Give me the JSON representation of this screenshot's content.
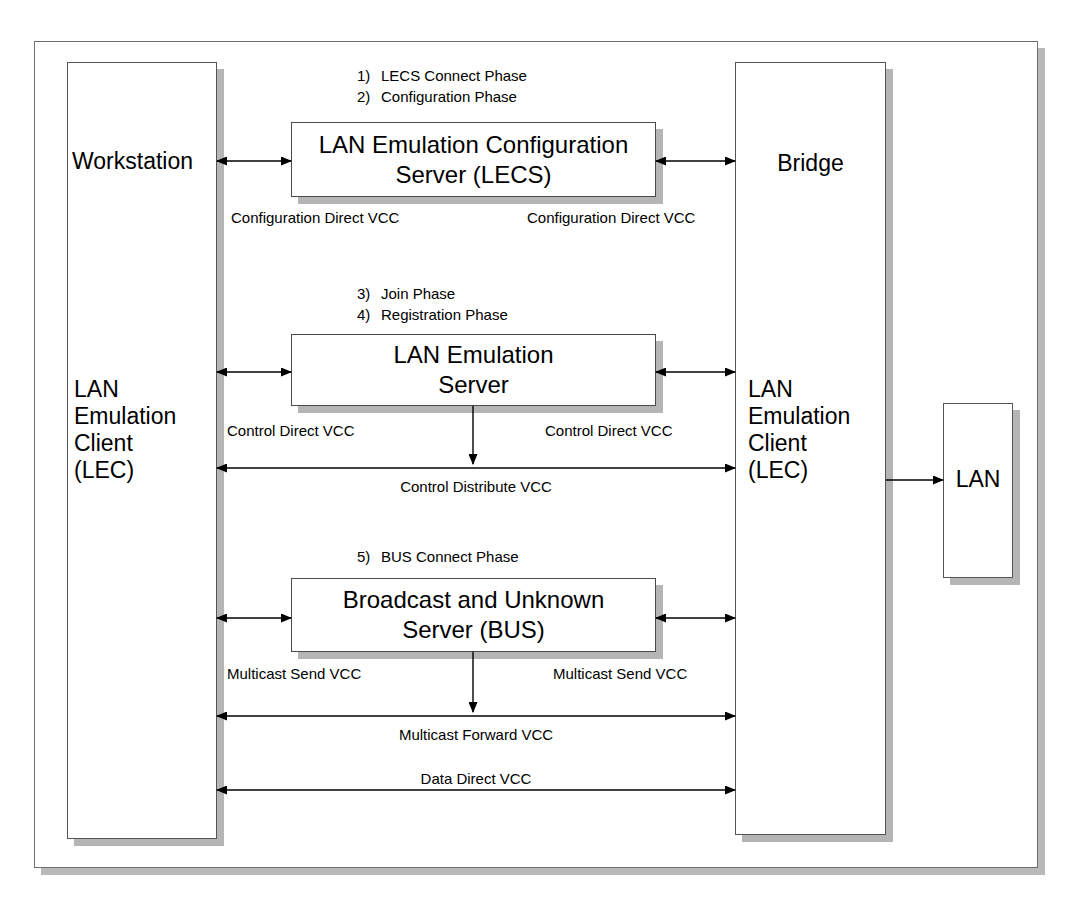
{
  "diagram": {
    "endpoints": {
      "left_column": {
        "top_label": "Workstation",
        "bottom_label": "LAN\nEmulation\nClient\n(LEC)"
      },
      "right_column": {
        "top_label": "Bridge",
        "bottom_label": "LAN\nEmulation\nClient\n(LEC)"
      },
      "lan": {
        "label": "LAN"
      }
    },
    "servers": [
      {
        "id": "lecs",
        "label": "LAN Emulation Configuration\nServer (LECS)"
      },
      {
        "id": "les",
        "label": "LAN Emulation\nServer"
      },
      {
        "id": "bus",
        "label": "Broadcast and Unknown\nServer (BUS)"
      }
    ],
    "phases": [
      {
        "num": "1)",
        "text": "LECS Connect Phase"
      },
      {
        "num": "2)",
        "text": "Configuration Phase"
      },
      {
        "num": "3)",
        "text": "Join Phase"
      },
      {
        "num": "4)",
        "text": "Registration Phase"
      },
      {
        "num": "5)",
        "text": "BUS Connect Phase"
      }
    ],
    "vcc_labels": {
      "config_direct_left": "Configuration Direct VCC",
      "config_direct_right": "Configuration Direct VCC",
      "control_direct_left": "Control Direct VCC",
      "control_direct_right": "Control Direct VCC",
      "control_distribute": "Control Distribute VCC",
      "multicast_send_left": "Multicast Send VCC",
      "multicast_send_right": "Multicast Send VCC",
      "multicast_forward": "Multicast Forward VCC",
      "data_direct": "Data Direct VCC"
    },
    "colors": {
      "line": "#000000",
      "box_border": "#4a4a4a",
      "shadow": "#b5b5b5",
      "background": "#ffffff"
    }
  }
}
